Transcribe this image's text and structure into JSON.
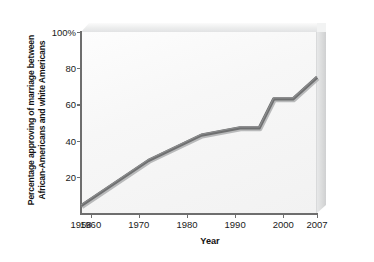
{
  "chart_data": {
    "type": "line",
    "title": "",
    "xlabel": "Year",
    "ylabel": "Percentage approving of marriage between African-Americans and white Americans",
    "ylabel_line1": "Percentage approving of marriage between",
    "ylabel_line2": "African-Americans and white Americans",
    "xlim": [
      1958,
      2007
    ],
    "ylim": [
      0,
      100
    ],
    "grid": false,
    "legend": null,
    "line_color": "#6f7071",
    "plot_background": "#f6f6f6",
    "xticks": [
      {
        "value": 1958,
        "label": "1958"
      },
      {
        "value": 1960,
        "label": "1960"
      },
      {
        "value": 1970,
        "label": "1970"
      },
      {
        "value": 1980,
        "label": "1980"
      },
      {
        "value": 1990,
        "label": "1990"
      },
      {
        "value": 2000,
        "label": "2000"
      },
      {
        "value": 2007,
        "label": "2007"
      }
    ],
    "yticks": [
      {
        "value": 100,
        "label": "100%"
      },
      {
        "value": 80,
        "label": "80"
      },
      {
        "value": 60,
        "label": "60"
      },
      {
        "value": 40,
        "label": "40"
      },
      {
        "value": 20,
        "label": "20"
      }
    ],
    "series": [
      {
        "name": "Percentage approving",
        "x": [
          1958,
          1972,
          1983,
          1991,
          1995,
          1998,
          2002,
          2007
        ],
        "values": [
          4,
          29,
          43,
          47,
          47,
          63,
          63,
          75
        ]
      }
    ]
  }
}
